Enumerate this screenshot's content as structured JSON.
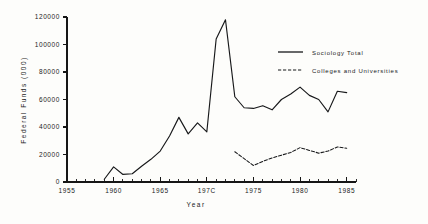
{
  "chart_data": {
    "type": "line",
    "title": "",
    "xlabel": "Year",
    "ylabel": "Federal Funds (000)",
    "xlim": [
      1955,
      1986
    ],
    "ylim": [
      0,
      120000
    ],
    "grid": false,
    "legend_position": "upper-right",
    "ytick_labels": [
      "0",
      "20000",
      "40000",
      "60000",
      "80000",
      "100000",
      "120000"
    ],
    "ytick_values": [
      0,
      20000,
      40000,
      60000,
      80000,
      100000,
      120000
    ],
    "xtick_labels": [
      "1955",
      "1960",
      "1965",
      "197C",
      "1975",
      "1980",
      "1985"
    ],
    "xtick_values": [
      1955,
      1960,
      1965,
      1970,
      1975,
      1980,
      1985
    ],
    "xtick_minor_step": 1,
    "series": [
      {
        "name": "Sociology Total",
        "style": "solid",
        "x": [
          1959,
          1960,
          1961,
          1962,
          1963,
          1964,
          1965,
          1966,
          1967,
          1968,
          1969,
          1970,
          1971,
          1972,
          1973,
          1974,
          1975,
          1976,
          1977,
          1978,
          1979,
          1980,
          1981,
          1982,
          1983,
          1984,
          1985
        ],
        "values": [
          2000,
          11000,
          5500,
          6000,
          11500,
          16500,
          22500,
          33500,
          47000,
          35000,
          43000,
          36500,
          104000,
          118000,
          62000,
          54000,
          53500,
          55500,
          52500,
          60000,
          64000,
          69000,
          63000,
          60000,
          51000,
          66000,
          65000
        ]
      },
      {
        "name": "Colleges and Universities",
        "style": "dashed",
        "x": [
          1973,
          1974,
          1975,
          1976,
          1977,
          1978,
          1979,
          1980,
          1981,
          1982,
          1983,
          1984,
          1985
        ],
        "values": [
          22000,
          17000,
          12000,
          15000,
          17500,
          19500,
          21500,
          25000,
          23000,
          21000,
          22500,
          25500,
          24500
        ]
      }
    ]
  },
  "legend": {
    "entries": [
      {
        "label": "Sociology Total",
        "style": "solid"
      },
      {
        "label": "Colleges and Universities",
        "style": "dashed"
      }
    ]
  }
}
